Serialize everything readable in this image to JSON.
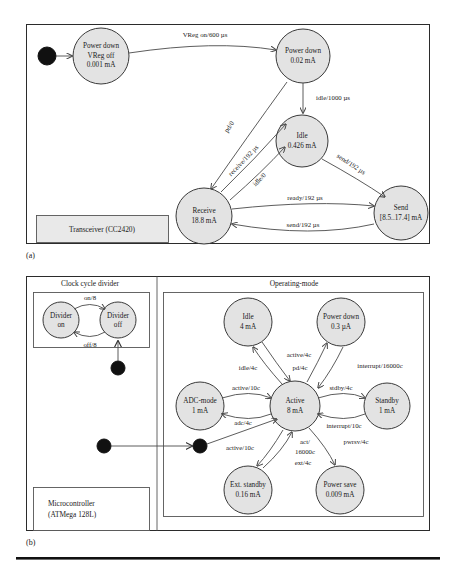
{
  "figure": {
    "subfigures": [
      {
        "key": "a",
        "label": "(a)"
      },
      {
        "key": "b",
        "label": "(b)"
      }
    ]
  },
  "panel_a": {
    "component_label_line1": "Transceiver (CC2420)",
    "states": [
      {
        "id": "pd_vreg_off",
        "line1": "Power down",
        "line2": "VReg off",
        "line3": "0.001 mA"
      },
      {
        "id": "power_down",
        "line1": "Power down",
        "line2": "0.02 mA",
        "line3": ""
      },
      {
        "id": "idle",
        "line1": "Idle",
        "line2": "0.426 mA",
        "line3": ""
      },
      {
        "id": "receive",
        "line1": "Receive",
        "line2": "18.8 mA",
        "line3": ""
      },
      {
        "id": "send",
        "line1": "Send",
        "line2": "[8.5..17.4] mA",
        "line3": ""
      }
    ],
    "transitions": [
      {
        "id": "vreg_on",
        "label": "VReg on/600 µs"
      },
      {
        "id": "idle_1000",
        "label": "idle/1000 µs"
      },
      {
        "id": "pd_0",
        "label": "pd/0"
      },
      {
        "id": "receive_192",
        "label": "receive/192 µs"
      },
      {
        "id": "idle_0",
        "label": "idle/0"
      },
      {
        "id": "send_192_idle",
        "label": "send/192 µs"
      },
      {
        "id": "ready_192",
        "label": "ready/192 µs"
      },
      {
        "id": "send_192_back",
        "label": "send/192 µs"
      }
    ]
  },
  "panel_b": {
    "region_titles": {
      "clock": "Clock cycle divider",
      "operating": "Operating-mode"
    },
    "component_label_line1": "Microcontroller",
    "component_label_line2": "(ATMega 128L)",
    "divider_states": [
      {
        "id": "divider_on",
        "line1": "Divider",
        "line2": "on"
      },
      {
        "id": "divider_off",
        "line1": "Divider",
        "line2": "off"
      }
    ],
    "divider_transitions": [
      {
        "id": "on_8",
        "label": "on/8"
      },
      {
        "id": "off_8",
        "label": "off/8"
      }
    ],
    "states": [
      {
        "id": "idle",
        "line1": "Idle",
        "line2": "4 mA"
      },
      {
        "id": "power_down",
        "line1": "Power down",
        "line2": "0.3 µA"
      },
      {
        "id": "adc_mode",
        "line1": "ADC-mode",
        "line2": "1 mA"
      },
      {
        "id": "active",
        "line1": "Active",
        "line2": "8 mA"
      },
      {
        "id": "standby",
        "line1": "Standby",
        "line2": "1 mA"
      },
      {
        "id": "ext_standby",
        "line1": "Ext. standby",
        "line2": "0.16 mA"
      },
      {
        "id": "power_save",
        "line1": "Power save",
        "line2": "0.009 mA"
      }
    ],
    "transitions": [
      {
        "id": "idle_4c",
        "label": "idle/4c"
      },
      {
        "id": "active_4c",
        "label": "active/4c"
      },
      {
        "id": "pd_4c",
        "label": "pd/4c"
      },
      {
        "id": "interrupt_16000c",
        "label": "interrupt/16000c"
      },
      {
        "id": "active_10c_adc",
        "label": "active/10c"
      },
      {
        "id": "adc_4c",
        "label": "adc/4c"
      },
      {
        "id": "stdby_4c",
        "label": "stdby/4c"
      },
      {
        "id": "interrupt_10c",
        "label": "interrupt/10c"
      },
      {
        "id": "active_10c_init",
        "label": "active/10c"
      },
      {
        "id": "act_16000c_a",
        "label": "act/"
      },
      {
        "id": "act_16000c_b",
        "label": "16000c"
      },
      {
        "id": "ext_4c",
        "label": "ext/4c"
      },
      {
        "id": "pwrsv_4c",
        "label": "pwrsv/4c"
      }
    ]
  },
  "colors": {
    "state_fill": "#e3e3e3",
    "state_stroke": "#3a3a3a",
    "label_box_fill": "#e9e9e9",
    "panel_stroke": "#2b2b2b",
    "edge_stroke": "#4a4a4a",
    "init_dot": "#111111"
  }
}
